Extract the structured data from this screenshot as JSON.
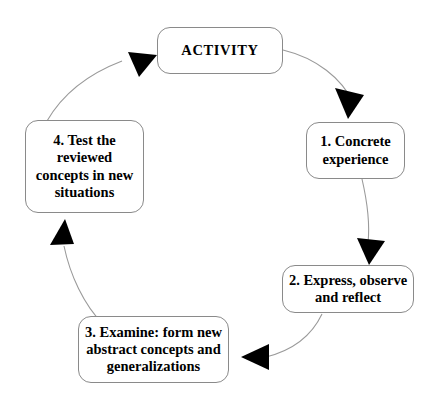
{
  "diagram": {
    "type": "cycle-diagram",
    "direction": "clockwise",
    "background_color": "#ffffff",
    "box_border_color": "#8a8a8a",
    "arc_color": "#9a9a9a",
    "arrow_color": "#000000",
    "text_color": "#000000",
    "nodes": [
      {
        "id": "activity",
        "label": "ACTIVITY",
        "position": "top",
        "order": 0
      },
      {
        "id": "step-1",
        "label": "1. Concrete\nexperience",
        "position": "right",
        "order": 1
      },
      {
        "id": "step-2",
        "label": "2. Express, observe\nand reflect",
        "position": "bottom-right",
        "order": 2
      },
      {
        "id": "step-3",
        "label": "3. Examine: form new\nabstract concepts and\ngeneralizations",
        "position": "bottom",
        "order": 3
      },
      {
        "id": "step-4",
        "label": "4. Test the\nreviewed\nconcepts in new\nsituations",
        "position": "left",
        "order": 4
      }
    ],
    "connectors": [
      {
        "id": "activity-to-step-1",
        "from": "activity",
        "to": "step-1"
      },
      {
        "id": "step-1-to-step-2",
        "from": "step-1",
        "to": "step-2"
      },
      {
        "id": "step-2-to-step-3",
        "from": "step-2",
        "to": "step-3"
      },
      {
        "id": "step-3-to-step-4",
        "from": "step-3",
        "to": "step-4"
      },
      {
        "id": "step-4-to-activity",
        "from": "step-4",
        "to": "activity"
      }
    ]
  }
}
